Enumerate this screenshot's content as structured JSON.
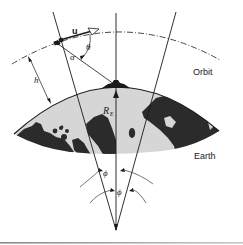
{
  "figure": {
    "labels": {
      "velocity_vector": "u",
      "theta": "θ",
      "alpha": "α",
      "altitude": "h",
      "earth_radius_main": "R",
      "earth_radius_sub": "E",
      "orbit": "Orbit",
      "earth": "Earth",
      "phi_upper": "ϕ",
      "phi_lower": "ϕ"
    },
    "colors": {
      "line": "#1a1a1a",
      "land": "#2a2a2a",
      "ocean": "#d4d4d4",
      "background": "#ffffff",
      "rule": "#9a9a9a"
    }
  }
}
